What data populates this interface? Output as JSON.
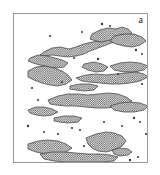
{
  "figure": {
    "panel_label": "a",
    "type": "binary-microstructure-micrograph",
    "background_color": "#ffffff",
    "frame_color": "#9a9a9a",
    "phase_fill_color": "#8d8d8d",
    "phase_outline_color": "#3a3a3a",
    "texture": "dot-screen-stipple",
    "texture_dot_spacing_px": 2.2,
    "frame": {
      "x": 13,
      "y": 13,
      "width": 135,
      "height": 150
    }
  },
  "chart_data": {
    "type": "heatmap",
    "title": "",
    "xlabel": "",
    "ylabel": "",
    "legend": [],
    "grid": false,
    "xlim": [
      0,
      135
    ],
    "ylim": [
      0,
      150
    ],
    "note": "Binary phase map. Each entry of 'regions' is one connected stippled (second-phase) domain, given as a closed polygon in frame-local pixel coordinates.",
    "regions": [
      {
        "id": "r01",
        "band": "top",
        "points": "30,38 38,34 46,33 55,35 62,33 70,30 78,28 86,27 92,24 98,22 104,24 100,28 92,31 84,34 76,37 70,40 62,42 54,43 46,42 38,41 31,42 26,41"
      },
      {
        "id": "r02",
        "band": "top",
        "points": "16,44 24,41 33,42 41,44 48,46 54,49 50,53 42,54 34,53 26,51 19,49 14,47"
      },
      {
        "id": "r03",
        "band": "top",
        "points": "78,20 86,16 94,14 102,15 108,13 114,15 118,19 112,22 104,24 96,26 88,28 82,27 76,25"
      },
      {
        "id": "r04",
        "band": "top",
        "points": "100,22 110,20 120,20 128,23 132,27 126,31 118,33 110,32 102,30 96,27"
      },
      {
        "id": "r05",
        "band": "upper-mid",
        "points": "14,57 22,53 31,52 40,54 48,57 54,61 58,66 52,70 44,72 36,71 28,69 20,66 14,63"
      },
      {
        "id": "r06",
        "band": "upper-mid",
        "points": "70,50 80,48 88,50 94,53 90,57 82,58 74,56 68,53"
      },
      {
        "id": "r07",
        "band": "upper-mid",
        "points": "96,52 106,49 116,48 126,49 134,52 130,56 120,58 110,58 100,56"
      },
      {
        "id": "r08",
        "band": "mid",
        "points": "62,64 72,61 82,60 92,61 102,60 112,59 122,58 130,60 134,63 126,67 116,69 106,70 96,70 86,69 76,68 68,67"
      },
      {
        "id": "r09",
        "band": "mid",
        "points": "56,72 66,70 76,70 84,72 80,76 70,77 62,76 56,75"
      },
      {
        "id": "r10",
        "band": "center",
        "points": "34,86 44,82 54,80 64,80 74,81 84,80 94,79 104,80 112,83 118,87 112,91 102,93 92,94 82,94 72,93 62,92 52,92 42,91 36,90"
      },
      {
        "id": "r11",
        "band": "center",
        "points": "96,92 106,89 116,88 126,89 134,92 130,96 120,98 110,98 100,96"
      },
      {
        "id": "r12",
        "band": "lower-mid",
        "points": "14,96 22,93 30,93 38,95 44,98 38,101 30,102 22,101 16,99"
      },
      {
        "id": "r13",
        "band": "lower-mid",
        "points": "40,104 50,102 60,102 68,104 64,108 54,109 46,108 40,107"
      },
      {
        "id": "r14",
        "band": "bottom",
        "points": "72,124 82,120 92,118 100,119 108,122 112,127 108,132 100,136 92,138 84,137 78,134 74,130"
      },
      {
        "id": "r15",
        "band": "bottom",
        "points": "14,130 24,127 34,126 44,127 52,130 58,134 52,138 42,140 32,140 22,138 14,135"
      },
      {
        "id": "r16",
        "band": "bottom",
        "points": "26,140 38,138 50,138 62,139 74,140 86,140 96,141 104,143 100,147 88,148 76,148 64,148 52,148 40,147 30,145"
      },
      {
        "id": "r17",
        "band": "bottom-right",
        "points": "98,136 106,134 114,135 118,138 114,141 106,142 100,140"
      }
    ],
    "speckles": [
      {
        "x": 88,
        "y": 10,
        "r": 1.2
      },
      {
        "x": 96,
        "y": 12,
        "r": 1.0
      },
      {
        "x": 36,
        "y": 22,
        "r": 1.1
      },
      {
        "x": 68,
        "y": 18,
        "r": 1.0
      },
      {
        "x": 122,
        "y": 36,
        "r": 1.2
      },
      {
        "x": 128,
        "y": 40,
        "r": 1.0
      },
      {
        "x": 18,
        "y": 74,
        "r": 1.1
      },
      {
        "x": 60,
        "y": 44,
        "r": 1.0
      },
      {
        "x": 84,
        "y": 45,
        "r": 1.2
      },
      {
        "x": 128,
        "y": 70,
        "r": 1.1
      },
      {
        "x": 120,
        "y": 104,
        "r": 1.2
      },
      {
        "x": 126,
        "y": 108,
        "r": 1.0
      },
      {
        "x": 58,
        "y": 114,
        "r": 1.1
      },
      {
        "x": 66,
        "y": 116,
        "r": 1.0
      },
      {
        "x": 14,
        "y": 112,
        "r": 1.2
      },
      {
        "x": 108,
        "y": 112,
        "r": 1.0
      },
      {
        "x": 44,
        "y": 120,
        "r": 1.1
      },
      {
        "x": 90,
        "y": 108,
        "r": 1.0
      },
      {
        "x": 116,
        "y": 146,
        "r": 1.2
      },
      {
        "x": 124,
        "y": 143,
        "r": 1.0
      },
      {
        "x": 70,
        "y": 132,
        "r": 1.1
      },
      {
        "x": 30,
        "y": 118,
        "r": 1.0
      },
      {
        "x": 104,
        "y": 60,
        "r": 1.0
      },
      {
        "x": 48,
        "y": 68,
        "r": 1.1
      },
      {
        "x": 24,
        "y": 86,
        "r": 1.0
      },
      {
        "x": 132,
        "y": 120,
        "r": 1.1
      }
    ]
  }
}
